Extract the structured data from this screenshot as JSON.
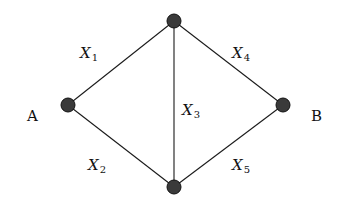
{
  "diagram": {
    "type": "network-graph",
    "nodes": [
      {
        "id": "A",
        "label": "A",
        "x": 68,
        "y": 105,
        "label_x": 27,
        "label_y": 121
      },
      {
        "id": "T",
        "label": "",
        "x": 174,
        "y": 21
      },
      {
        "id": "D",
        "label": "",
        "x": 174,
        "y": 187
      },
      {
        "id": "B",
        "label": "B",
        "x": 283,
        "y": 105,
        "label_x": 311,
        "label_y": 121
      }
    ],
    "edges": [
      {
        "id": "e1",
        "from": "A",
        "to": "T",
        "var": "X",
        "sub": "1",
        "label_x": 80,
        "label_y": 58
      },
      {
        "id": "e2",
        "from": "A",
        "to": "D",
        "var": "X",
        "sub": "2",
        "label_x": 88,
        "label_y": 170
      },
      {
        "id": "e3",
        "from": "T",
        "to": "D",
        "var": "X",
        "sub": "3",
        "label_x": 182,
        "label_y": 115
      },
      {
        "id": "e4",
        "from": "T",
        "to": "B",
        "var": "X",
        "sub": "4",
        "label_x": 232,
        "label_y": 58
      },
      {
        "id": "e5",
        "from": "D",
        "to": "B",
        "var": "X",
        "sub": "5",
        "label_x": 232,
        "label_y": 170
      }
    ],
    "colors": {
      "edge": "#1a1a1a",
      "node_fill": "#3a3a3a",
      "text": "#111111",
      "background": "#ffffff"
    }
  }
}
